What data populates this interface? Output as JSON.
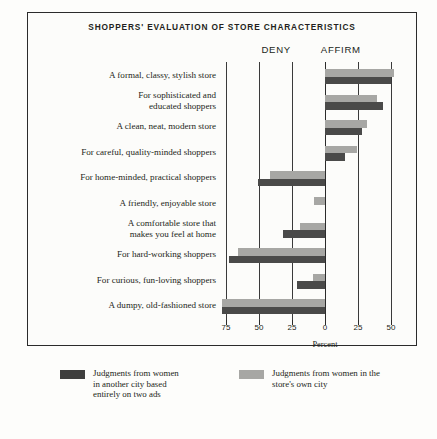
{
  "figure": {
    "title": "SHOPPERS' EVALUATION OF STORE CHARACTERISTICS",
    "axis_title": "Percent",
    "left_heading": "DENY",
    "right_heading": "AFFIRM",
    "caption": ""
  },
  "legend": {
    "items": [
      {
        "key": "other",
        "swatch": "dark-swatch",
        "label": "Judgments from women\nin another city based\nentirely on two ads",
        "color": "#3f3f3e"
      },
      {
        "key": "own",
        "swatch": "light-swatch",
        "label": "Judgments from women in the\nstore's own city",
        "color": "#a7a7a4"
      }
    ]
  },
  "chart_data": {
    "type": "bar",
    "orientation": "horizontal",
    "title": "SHOPPERS' EVALUATION OF STORE CHARACTERISTICS",
    "xlabel": "Percent",
    "ylabel": "",
    "grid": true,
    "legend_position": "bottom",
    "xlim": [
      -80,
      58
    ],
    "xticks": [
      -75,
      -50,
      -25,
      0,
      25,
      50
    ],
    "xticklabels": [
      "75",
      "50",
      "25",
      "0",
      "25",
      "50"
    ],
    "axis_side_labels": {
      "negative": "DENY",
      "positive": "AFFIRM"
    },
    "categories": [
      "A formal, classy, stylish store",
      "For sophisticated and\neducated shoppers",
      "A clean, neat, modern store",
      "For careful, quality-minded shoppers",
      "For home-minded, practical shoppers",
      "A friendly, enjoyable store",
      "A comfortable store that\nmakes you feel at home",
      "For hard-working shoppers",
      "For curious, fun-loving shoppers",
      "A dumpy, old-fashioned store"
    ],
    "series": [
      {
        "name": "Judgments from women in the store's own city",
        "key": "own",
        "color": "#a7a7a4",
        "values": [
          52,
          39,
          32,
          24,
          -42,
          -8,
          -19,
          -66,
          -9,
          -78
        ]
      },
      {
        "name": "Judgments from women in another city based entirely on two ads",
        "key": "other",
        "color": "#4a4a49",
        "values": [
          50,
          44,
          28,
          15,
          -51,
          0,
          -32,
          -73,
          -21,
          -78
        ]
      }
    ]
  }
}
